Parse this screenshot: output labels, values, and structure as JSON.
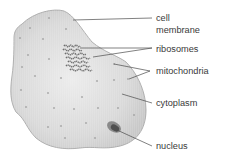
{
  "diagram": {
    "labels": [
      {
        "id": "cell-membrane",
        "lines": [
          "cell",
          "membrane"
        ]
      },
      {
        "id": "ribosomes",
        "lines": [
          "ribosomes"
        ]
      },
      {
        "id": "mitochondria",
        "lines": [
          "mitochondria"
        ]
      },
      {
        "id": "cytoplasm",
        "lines": [
          "cytoplasm"
        ]
      },
      {
        "id": "nucleus",
        "lines": [
          "nucleus"
        ]
      }
    ],
    "colors": {
      "cell_fill": "#d6d6d6",
      "cell_outline": "#a8a8a8",
      "nucleus_outer": "#7a7a7a",
      "nucleus_inner": "#4a4a4a",
      "ribosome": "#777777",
      "mitochondria": "#9a9a9a",
      "leader_line": "#4a4a4a",
      "text": "#3a3a3a"
    }
  }
}
